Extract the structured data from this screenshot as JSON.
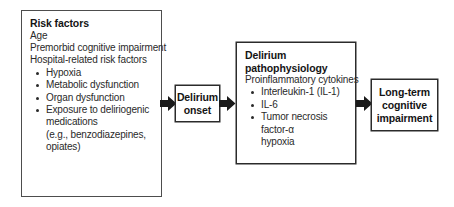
{
  "diagram": {
    "type": "flow-diagram",
    "background_color": "#ffffff",
    "border_color": "#4d4d4d",
    "text_color": "#2a2a2a",
    "arrow_color": "#1a1a1a"
  },
  "risk_factors": {
    "title": "Risk factors",
    "lines": [
      "Age",
      "Premorbid cognitive impairment",
      "Hospital-related risk factors"
    ],
    "bullets": [
      {
        "text": "Hypoxia",
        "bullet": true
      },
      {
        "text": "Metabolic dysfunction",
        "bullet": true
      },
      {
        "text": "Organ dysfunction",
        "bullet": true
      },
      {
        "text": "Exposure to deliriogenic",
        "bullet": true
      },
      {
        "text": "medications",
        "bullet": false
      },
      {
        "text": "(e.g., benzodiazepines,",
        "bullet": false
      },
      {
        "text": "opiates)",
        "bullet": false
      }
    ]
  },
  "delirium_onset": {
    "label": "Delirium\nonset"
  },
  "pathophysiology": {
    "title": "Delirium\npathophysiology",
    "lines": [
      "Proinflammatory cytokines"
    ],
    "bullets": [
      {
        "text": "Interleukin-1  (IL-1)",
        "bullet": true
      },
      {
        "text": "IL-6",
        "bullet": true
      },
      {
        "text": "Tumor necrosis factor-α",
        "bullet": true
      },
      {
        "text": "hypoxia",
        "bullet": false
      }
    ]
  },
  "outcome": {
    "label": "Long-term\ncognitive\nimpairment"
  },
  "arrows": [
    {
      "name": "arrow-risk-to-onset",
      "from": "risk_factors",
      "to": "delirium_onset"
    },
    {
      "name": "arrow-onset-to-pathophysiology",
      "from": "delirium_onset",
      "to": "pathophysiology"
    },
    {
      "name": "arrow-pathophysiology-to-outcome",
      "from": "pathophysiology",
      "to": "outcome"
    }
  ]
}
